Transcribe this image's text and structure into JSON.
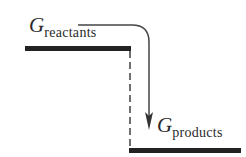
{
  "diagram": {
    "type": "energy-level-diagram",
    "reactants": {
      "symbol": "G",
      "subscript": "reactants"
    },
    "products": {
      "symbol": "G",
      "subscript": "products"
    },
    "colors": {
      "line": "#222222",
      "text": "#2a2a2a",
      "background": "#ffffff"
    }
  }
}
